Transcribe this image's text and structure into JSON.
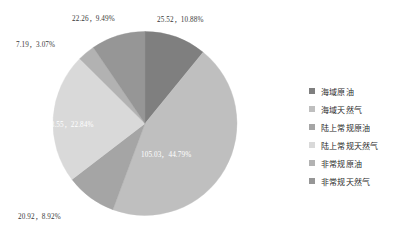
{
  "chart_data": {
    "type": "pie",
    "title": "",
    "legend_position": "right",
    "grid": false,
    "total": 234.47,
    "start_angle_deg": 0,
    "direction": "clockwise",
    "categories": [
      "海域原油",
      "海域天然气",
      "陆上常规原油",
      "陆上常规天然气",
      "非常规原油",
      "非常规天然气"
    ],
    "values": [
      25.52,
      105.03,
      20.92,
      53.55,
      7.19,
      22.26
    ],
    "percents": [
      10.88,
      44.79,
      8.92,
      22.84,
      3.07,
      9.49
    ],
    "colors": [
      "#7f7f7f",
      "#bfbfbf",
      "#a5a5a5",
      "#d9d9d9",
      "#b2b2b2",
      "#969696"
    ],
    "slices": [
      {
        "name": "海域原油",
        "value": 25.52,
        "percent": 10.88,
        "color": "#7f7f7f",
        "label": "25.52，10.88%",
        "label_placement": "outside"
      },
      {
        "name": "海域天然气",
        "value": 105.03,
        "percent": 44.79,
        "color": "#bfbfbf",
        "label": "105.03，44.79%",
        "label_placement": "inside"
      },
      {
        "name": "陆上常规原油",
        "value": 20.92,
        "percent": 8.92,
        "color": "#a5a5a5",
        "label": "20.92，8.92%",
        "label_placement": "outside"
      },
      {
        "name": "陆上常规天然气",
        "value": 53.55,
        "percent": 22.84,
        "color": "#d9d9d9",
        "label": "53.55，22.84%",
        "label_placement": "inside"
      },
      {
        "name": "非常规原油",
        "value": 7.19,
        "percent": 3.07,
        "color": "#b2b2b2",
        "label": "7.19，3.07%",
        "label_placement": "outside"
      },
      {
        "name": "非常规天然气",
        "value": 22.26,
        "percent": 9.49,
        "color": "#969696",
        "label": "22.26，9.49%",
        "label_placement": "outside"
      }
    ]
  },
  "legend": {
    "items": [
      {
        "label": "海域原油",
        "color": "#7f7f7f"
      },
      {
        "label": "海域天然气",
        "color": "#bfbfbf"
      },
      {
        "label": "陆上常规原油",
        "color": "#a5a5a5"
      },
      {
        "label": "陆上常规天然气",
        "color": "#d9d9d9"
      },
      {
        "label": "非常规原油",
        "color": "#b2b2b2"
      },
      {
        "label": "非常规天然气",
        "color": "#969696"
      }
    ]
  }
}
